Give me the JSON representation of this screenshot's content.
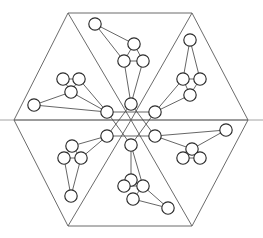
{
  "figure": {
    "background_color": "#ffffff",
    "line_color": "#5a5a5a",
    "bond_color": "#4a4a4a",
    "atom_outline_color": "#2b2b2b",
    "atom_fill_color": "#ffffff",
    "atom_shade_color": "#b9b9b9",
    "axis_color": "#9a9a9a",
    "symmetry": "6-fold rotational (C6)",
    "atom_radius": 6.2
  },
  "chart_data": {
    "type": "scatter",
    "xlabel": "",
    "ylabel": "",
    "xlim": [
      0,
      263
    ],
    "ylim": [
      238,
      0
    ],
    "grid": false,
    "legend": "none",
    "frame": {
      "name": "outer-hexagon",
      "vertices": [
        [
          68,
          13
        ],
        [
          192,
          13
        ],
        [
          248,
          120
        ],
        [
          192,
          226
        ],
        [
          68,
          226
        ],
        [
          14,
          120
        ]
      ]
    },
    "internal_spokes": {
      "name": "hexagon-center-spokes",
      "center": [
        131,
        120
      ],
      "to_vertices": [
        [
          68,
          13
        ],
        [
          192,
          13
        ],
        [
          248,
          120
        ],
        [
          192,
          226
        ],
        [
          68,
          226
        ],
        [
          14,
          120
        ]
      ]
    },
    "axis_line": {
      "name": "horizontal-axis",
      "from": [
        0,
        120
      ],
      "to": [
        263,
        120
      ]
    },
    "core_ring": {
      "name": "central-hexagon-nodes",
      "nodes": [
        [
          131,
          104
        ],
        [
          155,
          112
        ],
        [
          155,
          136
        ],
        [
          131,
          145
        ],
        [
          107,
          136
        ],
        [
          107,
          112
        ]
      ],
      "star_bonds": [
        [
          0,
          2
        ],
        [
          2,
          4
        ],
        [
          4,
          0
        ],
        [
          1,
          3
        ],
        [
          3,
          5
        ],
        [
          5,
          1
        ]
      ]
    },
    "branches": [
      {
        "name": "branch-top",
        "angle_deg": 90,
        "hub_node": [
          131,
          104
        ],
        "nodes": [
          [
            95,
            24
          ],
          [
            134,
            44
          ],
          [
            124,
            61
          ],
          [
            143,
            61
          ]
        ],
        "bonds": [
          [
            0,
            1
          ],
          [
            0,
            2
          ],
          [
            1,
            2
          ],
          [
            1,
            3
          ],
          [
            2,
            3
          ],
          [
            2,
            "hub"
          ],
          [
            3,
            "hub"
          ]
        ]
      },
      {
        "name": "branch-upper-right",
        "angle_deg": 30,
        "hub_node": [
          155,
          112
        ],
        "nodes": [
          [
            190,
            40
          ],
          [
            183,
            79
          ],
          [
            200,
            79
          ],
          [
            190,
            95
          ]
        ],
        "bonds": [
          [
            0,
            1
          ],
          [
            0,
            2
          ],
          [
            1,
            2
          ],
          [
            1,
            3
          ],
          [
            2,
            3
          ],
          [
            3,
            "hub"
          ],
          [
            1,
            "hub"
          ]
        ]
      },
      {
        "name": "branch-lower-right",
        "angle_deg": -30,
        "hub_node": [
          155,
          136
        ],
        "nodes": [
          [
            226,
            130
          ],
          [
            192,
            149
          ],
          [
            183,
            158
          ],
          [
            200,
            158
          ]
        ],
        "bonds": [
          [
            0,
            1
          ],
          [
            1,
            2
          ],
          [
            1,
            3
          ],
          [
            2,
            3
          ],
          [
            0,
            "hub"
          ],
          [
            1,
            "hub"
          ]
        ]
      },
      {
        "name": "branch-bottom",
        "angle_deg": -90,
        "hub_node": [
          131,
          145
        ],
        "nodes": [
          [
            131,
            180
          ],
          [
            124,
            186
          ],
          [
            143,
            186
          ],
          [
            133,
            199
          ],
          [
            168,
            208
          ]
        ],
        "bonds": [
          [
            0,
            1
          ],
          [
            0,
            2
          ],
          [
            1,
            2
          ],
          [
            2,
            3
          ],
          [
            3,
            4
          ],
          [
            2,
            4
          ],
          [
            0,
            "hub"
          ],
          [
            2,
            "hub"
          ]
        ]
      },
      {
        "name": "branch-lower-left",
        "angle_deg": -150,
        "hub_node": [
          107,
          136
        ],
        "nodes": [
          [
            72,
            146
          ],
          [
            64,
            158
          ],
          [
            81,
            158
          ],
          [
            71,
            196
          ]
        ],
        "bonds": [
          [
            0,
            1
          ],
          [
            0,
            2
          ],
          [
            1,
            2
          ],
          [
            1,
            3
          ],
          [
            2,
            3
          ],
          [
            0,
            "hub"
          ],
          [
            2,
            "hub"
          ]
        ]
      },
      {
        "name": "branch-upper-left",
        "angle_deg": 150,
        "hub_node": [
          107,
          112
        ],
        "nodes": [
          [
            34,
            105
          ],
          [
            63,
            79
          ],
          [
            79,
            79
          ],
          [
            71,
            92
          ]
        ],
        "bonds": [
          [
            1,
            2
          ],
          [
            1,
            3
          ],
          [
            2,
            3
          ],
          [
            0,
            3
          ],
          [
            0,
            "hub"
          ],
          [
            2,
            "hub"
          ],
          [
            3,
            "hub"
          ]
        ]
      }
    ]
  }
}
